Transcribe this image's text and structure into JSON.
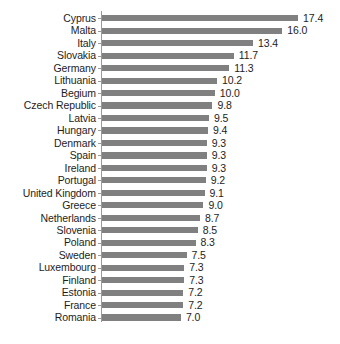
{
  "chart_data": {
    "type": "bar",
    "orientation": "horizontal",
    "title": "",
    "subtitle": "",
    "xlabel": "",
    "ylabel": "",
    "grid": false,
    "legend": null,
    "xlim": [
      0,
      17.4
    ],
    "axis": {
      "category_axis": "y",
      "value_axis": "x",
      "tick_labels": [],
      "value_label_format": "0.0"
    },
    "bar_color": "#808080",
    "label_color": "#1d1d1d",
    "background_color": "#ffffff",
    "categories": [
      "Cyprus",
      "Malta",
      "Italy",
      "Slovakia",
      "Germany",
      "Lithuania",
      "Begium",
      "Czech Republic",
      "Latvia",
      "Hungary",
      "Denmark",
      "Spain",
      "Ireland",
      "Portugal",
      "United Kingdom",
      "Greece",
      "Netherlands",
      "Slovenia",
      "Poland",
      "Sweden",
      "Luxembourg",
      "Finland",
      "Estonia",
      "France",
      "Romania"
    ],
    "values": [
      17.4,
      16.0,
      13.4,
      11.7,
      11.3,
      10.2,
      10.0,
      9.8,
      9.5,
      9.4,
      9.3,
      9.3,
      9.3,
      9.2,
      9.1,
      9.0,
      8.7,
      8.5,
      8.3,
      7.5,
      7.3,
      7.3,
      7.2,
      7.2,
      7.0
    ],
    "value_labels": [
      "17.4",
      "16.0",
      "13.4",
      "11.7",
      "11.3",
      "10.2",
      "10.0",
      "9.8",
      "9.5",
      "9.4",
      "9.3",
      "9.3",
      "9.3",
      "9.2",
      "9.1",
      "9.0",
      "8.7",
      "8.5",
      "8.3",
      "7.5",
      "7.3",
      "7.3",
      "7.2",
      "7.2",
      "7.0"
    ]
  }
}
